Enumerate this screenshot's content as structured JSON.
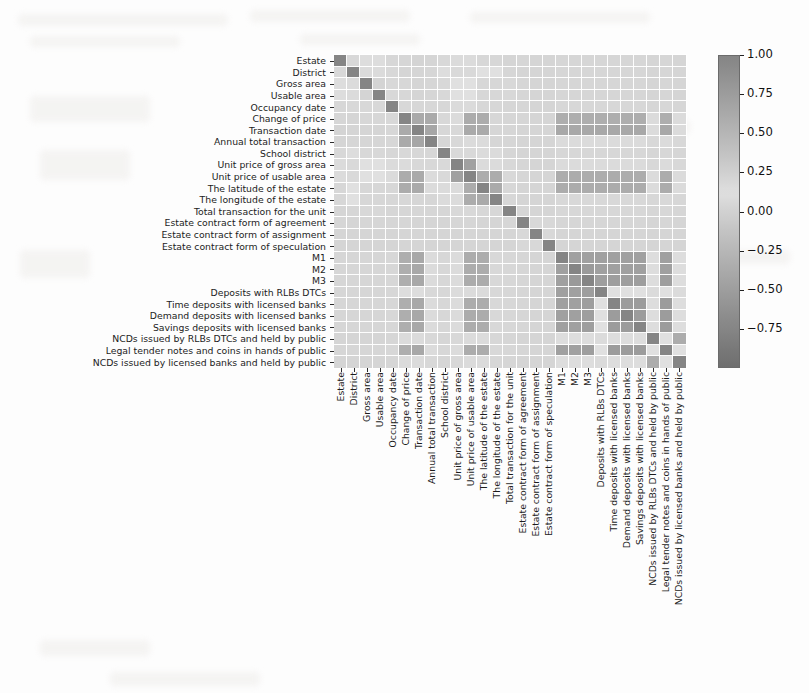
{
  "figure": {
    "type": "heatmap",
    "background_color": "#fdfdfd",
    "colormap": "grayscale-diverging"
  },
  "colorbar": {
    "orientation": "vertical",
    "vmin": -1.0,
    "vmax": 1.0,
    "ticks": [
      {
        "value": 1.0,
        "label": "1.00"
      },
      {
        "value": 0.75,
        "label": "0.75"
      },
      {
        "value": 0.5,
        "label": "0.50"
      },
      {
        "value": 0.25,
        "label": "0.25"
      },
      {
        "value": 0.0,
        "label": "0.00"
      },
      {
        "value": -0.25,
        "label": "−0.25"
      },
      {
        "value": -0.5,
        "label": "−0.50"
      },
      {
        "value": -0.75,
        "label": "−0.75"
      }
    ]
  },
  "chart_data": {
    "type": "heatmap",
    "title": "",
    "xlabel": "",
    "ylabel": "",
    "grid": true,
    "legend_position": "right",
    "zlim": [
      -1.0,
      1.0
    ],
    "colorbar_ticks": [
      1.0,
      0.75,
      0.5,
      0.25,
      0.0,
      -0.25,
      -0.5,
      -0.75
    ],
    "categories": [
      "Estate",
      "District",
      "Gross area",
      "Usable area",
      "Occupancy date",
      "Change of price",
      "Transaction date",
      "Annual total transaction",
      "School district",
      "Unit price of gross area",
      "Unit price of usable area",
      "The latitude of the estate",
      "The longitude of the estate",
      "Total transaction for the unit",
      "Estate contract form of agreement",
      "Estate contract form of assignment",
      "Estate contract form of speculation",
      "M1",
      "M2",
      "M3",
      "Deposits with RLBs DTCs",
      "Time deposits with licensed banks",
      "Demand deposits with licensed banks",
      "Savings deposits with licensed banks",
      "NCDs issued by RLBs DTCs and held by public",
      "Legal tender notes and coins in hands of public",
      "NCDs issued by licensed banks and held by public"
    ],
    "x": [
      "Estate",
      "District",
      "Gross area",
      "Usable area",
      "Occupancy date",
      "Change of price",
      "Transaction date",
      "Annual total transaction",
      "School district",
      "Unit price of gross area",
      "Unit price of usable area",
      "The latitude of the estate",
      "The longitude of the estate",
      "Total transaction for the unit",
      "Estate contract form of agreement",
      "Estate contract form of assignment",
      "Estate contract form of speculation",
      "M1",
      "M2",
      "M3",
      "Deposits with RLBs DTCs",
      "Time deposits with licensed banks",
      "Demand deposits with licensed banks",
      "Savings deposits with licensed banks",
      "NCDs issued by RLBs DTCs and held by public",
      "Legal tender notes and coins in hands of public",
      "NCDs issued by licensed banks and held by public"
    ],
    "y": [
      "Estate",
      "District",
      "Gross area",
      "Usable area",
      "Occupancy date",
      "Change of price",
      "Transaction date",
      "Annual total transaction",
      "School district",
      "Unit price of gross area",
      "Unit price of usable area",
      "The latitude of the estate",
      "The longitude of the estate",
      "Total transaction for the unit",
      "Estate contract form of agreement",
      "Estate contract form of assignment",
      "Estate contract form of speculation",
      "M1",
      "M2",
      "M3",
      "Deposits with RLBs DTCs",
      "Time deposits with licensed banks",
      "Demand deposits with licensed banks",
      "Savings deposits with licensed banks",
      "NCDs issued by RLBs DTCs and held by public",
      "Legal tender notes and coins in hands of public",
      "NCDs issued by licensed banks and held by public"
    ],
    "values": [
      [
        1.0,
        0.06,
        0.1,
        0.1,
        0.05,
        0.04,
        0.02,
        0.03,
        0.06,
        0.08,
        0.08,
        0.05,
        0.05,
        0.03,
        0.04,
        0.03,
        0.03,
        0.04,
        0.04,
        0.04,
        0.04,
        0.04,
        0.04,
        0.04,
        0.03,
        0.04,
        0.03
      ],
      [
        0.06,
        1.0,
        0.08,
        0.08,
        0.06,
        0.03,
        0.03,
        0.04,
        0.1,
        0.07,
        0.07,
        0.12,
        0.12,
        0.04,
        0.03,
        0.03,
        0.03,
        0.04,
        0.04,
        0.04,
        0.04,
        0.04,
        0.04,
        0.04,
        0.03,
        0.04,
        0.03
      ],
      [
        0.1,
        0.08,
        1.0,
        0.22,
        0.06,
        0.05,
        0.03,
        0.04,
        0.06,
        0.12,
        0.12,
        0.05,
        0.05,
        0.06,
        0.04,
        0.03,
        0.03,
        0.04,
        0.04,
        0.04,
        0.04,
        0.04,
        0.04,
        0.04,
        0.03,
        0.04,
        0.03
      ],
      [
        0.1,
        0.08,
        0.22,
        1.0,
        0.06,
        0.05,
        0.03,
        0.04,
        0.06,
        0.12,
        0.12,
        0.05,
        0.05,
        0.06,
        0.04,
        0.03,
        0.03,
        0.04,
        0.04,
        0.04,
        0.04,
        0.04,
        0.04,
        0.04,
        0.03,
        0.04,
        0.03
      ],
      [
        0.05,
        0.06,
        0.06,
        0.06,
        1.0,
        0.06,
        0.05,
        0.05,
        0.05,
        0.08,
        0.08,
        0.05,
        0.05,
        0.04,
        0.04,
        0.03,
        0.03,
        0.05,
        0.05,
        0.05,
        0.05,
        0.05,
        0.05,
        0.05,
        0.04,
        0.05,
        0.04
      ],
      [
        0.04,
        0.03,
        0.05,
        0.05,
        0.06,
        1.0,
        0.62,
        0.62,
        0.06,
        0.08,
        0.6,
        0.6,
        0.05,
        0.04,
        0.04,
        0.03,
        0.03,
        0.58,
        0.58,
        0.58,
        0.58,
        0.58,
        0.58,
        0.58,
        0.08,
        0.58,
        0.08
      ],
      [
        0.02,
        0.03,
        0.03,
        0.03,
        0.05,
        0.62,
        1.0,
        0.66,
        0.05,
        0.06,
        0.62,
        0.62,
        0.04,
        0.04,
        0.03,
        0.03,
        0.03,
        0.64,
        0.64,
        0.64,
        0.64,
        0.64,
        0.64,
        0.64,
        0.08,
        0.64,
        0.08
      ],
      [
        0.03,
        0.04,
        0.04,
        0.04,
        0.05,
        0.62,
        0.66,
        1.0,
        0.05,
        0.06,
        0.08,
        0.08,
        0.04,
        0.04,
        0.03,
        0.03,
        0.03,
        0.08,
        0.08,
        0.08,
        0.08,
        0.08,
        0.08,
        0.08,
        0.06,
        0.08,
        0.06
      ],
      [
        0.06,
        0.1,
        0.06,
        0.06,
        0.05,
        0.06,
        0.05,
        0.05,
        1.0,
        0.07,
        0.07,
        0.08,
        0.08,
        0.04,
        0.03,
        0.03,
        0.03,
        0.05,
        0.05,
        0.05,
        0.05,
        0.05,
        0.05,
        0.05,
        0.04,
        0.05,
        0.04
      ],
      [
        0.08,
        0.07,
        0.12,
        0.12,
        0.08,
        0.08,
        0.06,
        0.06,
        0.07,
        1.0,
        0.72,
        0.08,
        0.08,
        0.06,
        0.04,
        0.03,
        0.03,
        0.08,
        0.08,
        0.08,
        0.08,
        0.08,
        0.08,
        0.08,
        0.06,
        0.08,
        0.06
      ],
      [
        0.08,
        0.07,
        0.12,
        0.12,
        0.08,
        0.6,
        0.62,
        0.08,
        0.07,
        0.72,
        1.0,
        0.6,
        0.6,
        0.06,
        0.04,
        0.03,
        0.03,
        0.6,
        0.6,
        0.6,
        0.6,
        0.6,
        0.6,
        0.6,
        0.08,
        0.6,
        0.08
      ],
      [
        0.05,
        0.12,
        0.05,
        0.05,
        0.05,
        0.6,
        0.62,
        0.08,
        0.08,
        0.08,
        0.6,
        1.0,
        0.62,
        0.05,
        0.03,
        0.03,
        0.03,
        0.6,
        0.6,
        0.6,
        0.6,
        0.6,
        0.6,
        0.6,
        0.08,
        0.6,
        0.08
      ],
      [
        0.05,
        0.12,
        0.05,
        0.05,
        0.05,
        0.05,
        0.04,
        0.04,
        0.08,
        0.08,
        0.6,
        0.62,
        1.0,
        0.05,
        0.03,
        0.03,
        0.03,
        0.06,
        0.06,
        0.06,
        0.06,
        0.06,
        0.06,
        0.06,
        0.05,
        0.06,
        0.05
      ],
      [
        0.03,
        0.04,
        0.06,
        0.06,
        0.04,
        0.04,
        0.04,
        0.04,
        0.04,
        0.06,
        0.06,
        0.05,
        0.05,
        1.0,
        0.04,
        0.03,
        0.03,
        0.05,
        0.05,
        0.05,
        0.05,
        0.05,
        0.05,
        0.05,
        0.04,
        0.05,
        0.04
      ],
      [
        0.04,
        0.03,
        0.04,
        0.04,
        0.04,
        0.04,
        0.03,
        0.03,
        0.03,
        0.04,
        0.04,
        0.03,
        0.03,
        0.04,
        1.0,
        0.06,
        0.06,
        0.04,
        0.04,
        0.04,
        0.04,
        0.04,
        0.04,
        0.04,
        0.03,
        0.04,
        0.03
      ],
      [
        0.03,
        0.03,
        0.03,
        0.03,
        0.03,
        0.03,
        0.03,
        0.03,
        0.03,
        0.03,
        0.03,
        0.03,
        0.03,
        0.03,
        0.06,
        1.0,
        0.06,
        0.03,
        0.03,
        0.03,
        0.03,
        0.03,
        0.03,
        0.03,
        0.03,
        0.03,
        0.03
      ],
      [
        0.03,
        0.03,
        0.03,
        0.03,
        0.03,
        0.03,
        0.03,
        0.03,
        0.03,
        0.03,
        0.03,
        0.03,
        0.03,
        0.03,
        0.06,
        0.06,
        1.0,
        0.03,
        0.03,
        0.03,
        0.03,
        0.03,
        0.03,
        0.03,
        0.03,
        0.03,
        0.03
      ],
      [
        0.04,
        0.04,
        0.04,
        0.04,
        0.05,
        0.58,
        0.64,
        0.08,
        0.05,
        0.08,
        0.6,
        0.6,
        0.06,
        0.05,
        0.04,
        0.03,
        0.03,
        1.0,
        0.72,
        0.72,
        0.72,
        0.72,
        0.72,
        0.72,
        0.1,
        0.72,
        0.1
      ],
      [
        0.04,
        0.04,
        0.04,
        0.04,
        0.05,
        0.58,
        0.64,
        0.08,
        0.05,
        0.08,
        0.6,
        0.6,
        0.06,
        0.05,
        0.04,
        0.03,
        0.03,
        0.72,
        1.0,
        0.78,
        0.72,
        0.72,
        0.72,
        0.72,
        0.1,
        0.72,
        0.1
      ],
      [
        0.04,
        0.04,
        0.04,
        0.04,
        0.05,
        0.58,
        0.64,
        0.08,
        0.05,
        0.08,
        0.6,
        0.6,
        0.06,
        0.05,
        0.04,
        0.03,
        0.03,
        0.72,
        0.78,
        1.0,
        0.74,
        0.74,
        0.74,
        0.74,
        0.1,
        0.74,
        0.1
      ],
      [
        0.04,
        0.04,
        0.04,
        0.04,
        0.05,
        0.1,
        0.1,
        0.06,
        0.05,
        0.08,
        0.08,
        0.08,
        0.06,
        0.05,
        0.04,
        0.03,
        0.03,
        0.72,
        0.72,
        0.74,
        1.0,
        0.12,
        0.12,
        0.12,
        0.08,
        0.12,
        0.08
      ],
      [
        0.04,
        0.04,
        0.04,
        0.04,
        0.05,
        0.58,
        0.64,
        0.08,
        0.05,
        0.08,
        0.6,
        0.6,
        0.06,
        0.05,
        0.04,
        0.03,
        0.03,
        0.72,
        0.72,
        0.74,
        0.12,
        1.0,
        0.76,
        0.76,
        0.1,
        0.76,
        0.1
      ],
      [
        0.04,
        0.04,
        0.04,
        0.04,
        0.05,
        0.58,
        0.64,
        0.08,
        0.05,
        0.08,
        0.6,
        0.6,
        0.06,
        0.05,
        0.04,
        0.03,
        0.03,
        0.72,
        0.72,
        0.74,
        0.12,
        0.76,
        1.0,
        0.76,
        0.1,
        0.76,
        0.1
      ],
      [
        0.04,
        0.04,
        0.04,
        0.04,
        0.05,
        0.58,
        0.64,
        0.08,
        0.05,
        0.08,
        0.6,
        0.6,
        0.06,
        0.05,
        0.04,
        0.03,
        0.03,
        0.72,
        0.72,
        0.74,
        0.12,
        0.76,
        0.76,
        1.0,
        0.1,
        0.76,
        0.1
      ],
      [
        0.03,
        0.03,
        0.03,
        0.03,
        0.04,
        0.08,
        0.08,
        0.06,
        0.04,
        0.06,
        0.08,
        0.08,
        0.05,
        0.04,
        0.03,
        0.03,
        0.03,
        0.1,
        0.1,
        0.1,
        0.08,
        0.1,
        0.1,
        0.1,
        1.0,
        0.12,
        0.6
      ],
      [
        0.04,
        0.04,
        0.04,
        0.04,
        0.05,
        0.58,
        0.64,
        0.08,
        0.05,
        0.08,
        0.6,
        0.6,
        0.06,
        0.05,
        0.04,
        0.03,
        0.03,
        0.72,
        0.72,
        0.74,
        0.12,
        0.76,
        0.76,
        0.76,
        0.12,
        1.0,
        0.12
      ],
      [
        0.03,
        0.03,
        0.03,
        0.03,
        0.04,
        0.08,
        0.08,
        0.06,
        0.04,
        0.06,
        0.08,
        0.08,
        0.05,
        0.04,
        0.03,
        0.03,
        0.03,
        0.1,
        0.1,
        0.1,
        0.08,
        0.1,
        0.1,
        0.1,
        0.6,
        0.12,
        1.0
      ]
    ]
  }
}
